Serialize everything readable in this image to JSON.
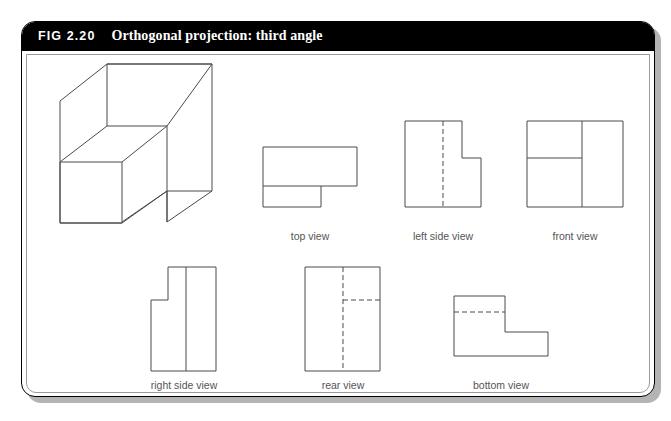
{
  "figure": {
    "number": "FIG 2.20",
    "caption": "Orthogonal projection: third angle",
    "header_bg": "#000000",
    "header_text_color": "#ffffff",
    "line_color": "#4a4a4a",
    "label_color": "#555555",
    "card_bg": "#ffffff"
  },
  "views": [
    {
      "id": "isometric",
      "label": "",
      "label_x": 0,
      "label_y": 0
    },
    {
      "id": "top-view",
      "label": "top view",
      "label_x": 310,
      "label_y": 230
    },
    {
      "id": "left-side-view",
      "label": "left side view",
      "label_x": 443,
      "label_y": 230
    },
    {
      "id": "front-view",
      "label": "front view",
      "label_x": 575,
      "label_y": 230
    },
    {
      "id": "right-side-view",
      "label": "right side view",
      "label_x": 184,
      "label_y": 379
    },
    {
      "id": "rear-view",
      "label": "rear view",
      "label_x": 343,
      "label_y": 379
    },
    {
      "id": "bottom-view",
      "label": "bottom view",
      "label_x": 501,
      "label_y": 379
    }
  ],
  "geometry": {
    "isometric": {
      "description": "L-shaped stepped block in isometric projection",
      "solid_paths": [
        "M 107 64 L 212 64 L 212 191 L 167 222 L 122 222 L 122 162 L 60 162 L 60 223 L 122 223",
        "M 107 64 L 60 101 L 60 162",
        "M 60 162 L 122 162 L 167 126 L 107 126 L 60 162",
        "M 107 126 L 107 64",
        "M 167 126 L 167 222",
        "M 122 162 L 122 222",
        "M 167 126 L 212 64",
        "M 167 191 L 212 191",
        "M 60 223 L 122 223 L 167 191"
      ]
    },
    "top_view": {
      "outline": "M 263 147 L 357 147 L 357 186 L 321 186 L 321 207 L 263 207 Z",
      "solid_lines": [
        "M 263 186 L 321 186"
      ]
    },
    "left_side_view": {
      "outline": "M 405 121 L 462 121 L 462 158 L 481 158 L 481 207 L 405 207 Z",
      "hidden_lines": [
        "M 443 121 L 443 207"
      ]
    },
    "front_view": {
      "outline": "M 527 121 L 623 121 L 623 207 L 527 207 Z",
      "solid_lines": [
        "M 582 121 L 582 207",
        "M 527 158 L 582 158"
      ]
    },
    "right_side_view": {
      "outline": "M 151 300 L 168 300 L 168 267 L 216 267 L 216 371 L 151 371 Z",
      "solid_lines": [
        "M 186 267 L 186 371"
      ]
    },
    "rear_view": {
      "outline": "M 305 267 L 380 267 L 380 371 L 305 371 Z",
      "hidden_lines": [
        "M 343 267 L 343 371",
        "M 343 300 L 380 300"
      ]
    },
    "bottom_view": {
      "outline": "M 454 296 L 505 296 L 505 332 L 548 332 L 548 356 L 454 356 Z",
      "hidden_lines": [
        "M 454 312 L 505 312"
      ]
    }
  }
}
